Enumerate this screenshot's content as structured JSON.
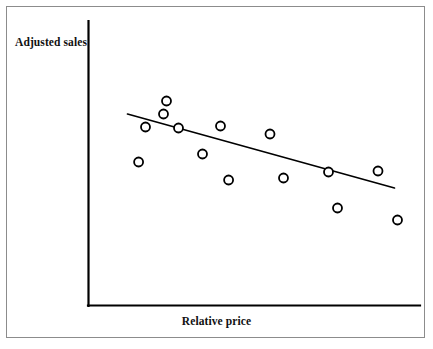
{
  "chart_data": {
    "type": "scatter",
    "title": "",
    "xlabel": "Relative price",
    "ylabel": "Adjusted sales",
    "grid": false,
    "legend": null,
    "axis_ticks": {
      "x": [],
      "y": []
    },
    "xlim": [
      0,
      100
    ],
    "ylim": [
      0,
      100
    ],
    "points": [
      {
        "x": 12.5,
        "y": 67.0
      },
      {
        "x": 10.2,
        "y": 49.5
      },
      {
        "x": 19.5,
        "y": 80.0
      },
      {
        "x": 18.5,
        "y": 73.5
      },
      {
        "x": 23.5,
        "y": 66.5
      },
      {
        "x": 31.5,
        "y": 53.5
      },
      {
        "x": 37.5,
        "y": 67.5
      },
      {
        "x": 40.2,
        "y": 40.5
      },
      {
        "x": 54.0,
        "y": 63.5
      },
      {
        "x": 58.5,
        "y": 41.5
      },
      {
        "x": 73.5,
        "y": 44.5
      },
      {
        "x": 76.5,
        "y": 26.5
      },
      {
        "x": 90.0,
        "y": 45.0
      },
      {
        "x": 96.5,
        "y": 20.5
      }
    ],
    "trendline": {
      "label": "fitted regression line",
      "x_start": 6.5,
      "y_start": 73.5,
      "x_end": 95.5,
      "y_end": 36.5,
      "slope_direction": "negative"
    },
    "marker": {
      "shape": "circle-open",
      "size_px": 9,
      "stroke": "#000000",
      "fill": "#ffffff"
    },
    "colors": {
      "axis": "#000000",
      "line": "#000000",
      "frame": "#8c8c8c",
      "text": "#111111",
      "background": "#ffffff"
    }
  },
  "figure": {
    "frame_visible": true,
    "y_axis_label": "Adjusted sales",
    "x_axis_label": "Relative price"
  }
}
